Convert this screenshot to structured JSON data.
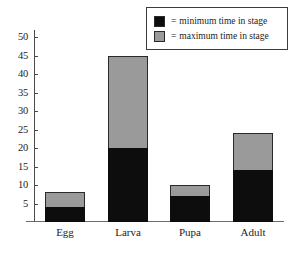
{
  "chart_data": {
    "type": "bar",
    "subtype": "stacked-range-bar",
    "title": "",
    "subtitle": "",
    "xlabel": "",
    "ylabel": "",
    "categories": [
      "Egg",
      "Larva",
      "Pupa",
      "Adult"
    ],
    "series": [
      {
        "name": "minimum time in stage",
        "color": "#0d0d0d",
        "values": [
          4,
          20,
          7,
          14
        ]
      },
      {
        "name": "maximum time in stage",
        "color": "#9a9a9a",
        "values": [
          8,
          45,
          10,
          24
        ]
      }
    ],
    "ylim": [
      0,
      52
    ],
    "yticks": [
      5,
      10,
      15,
      20,
      25,
      30,
      35,
      40,
      45,
      50
    ],
    "ytick_labels": [
      "5",
      "10",
      "15",
      "20",
      "25",
      "30",
      "35",
      "40",
      "45",
      "50"
    ],
    "grid": false,
    "legend_position": "top-right",
    "legend": [
      {
        "marker": "black-square",
        "separator": "=",
        "label": "minimum time in stage"
      },
      {
        "marker": "gray-square",
        "separator": "=",
        "label": "maximum time in stage"
      }
    ]
  },
  "colors": {
    "minimum": "#0d0d0d",
    "maximum": "#9a9a9a",
    "axis": "#4a4a4a",
    "baseline": "#6b6b6b",
    "legend_border": "#3c3c3c",
    "background": "#ffffff",
    "text": "#1d1d1d"
  }
}
